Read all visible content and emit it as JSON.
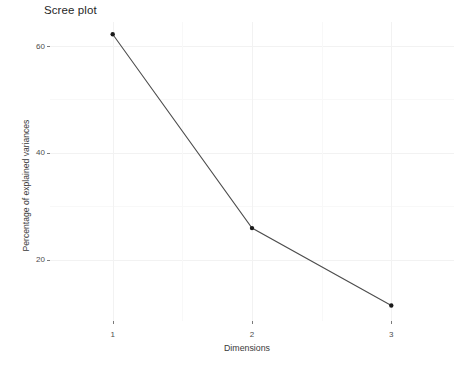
{
  "chart_data": {
    "type": "line",
    "title": "Scree plot",
    "xlabel": "Dimensions",
    "ylabel": "Percentage of explained variances",
    "categories": [
      "1",
      "2",
      "3"
    ],
    "x": [
      1,
      2,
      3
    ],
    "values": [
      62.2,
      25.9,
      11.4
    ],
    "series": [
      {
        "name": "Percentage of explained variances",
        "values": [
          62.2,
          25.9,
          11.4
        ]
      }
    ],
    "xlim": [
      0.55,
      3.45
    ],
    "ylim": [
      8.5,
      64.5
    ],
    "x_ticks": [
      "1",
      "2",
      "3"
    ],
    "y_ticks": [
      "20",
      "40",
      "60"
    ],
    "y_tick_values": [
      20,
      40,
      60
    ],
    "y_minor_tick_values": [
      30,
      50
    ],
    "grid": true,
    "legend": "none",
    "marker": "point",
    "line_color": "#4d4d4d",
    "point_color": "#1a1a1a",
    "panel_background": "#ffffff",
    "grid_color": "#f2f2f2"
  },
  "axes": {
    "y_ticks": [
      {
        "label": "60",
        "value": 60
      },
      {
        "label": "40",
        "value": 40
      },
      {
        "label": "20",
        "value": 20
      }
    ],
    "x_ticks": [
      {
        "label": "1",
        "value": 1
      },
      {
        "label": "2",
        "value": 2
      },
      {
        "label": "3",
        "value": 3
      }
    ]
  }
}
